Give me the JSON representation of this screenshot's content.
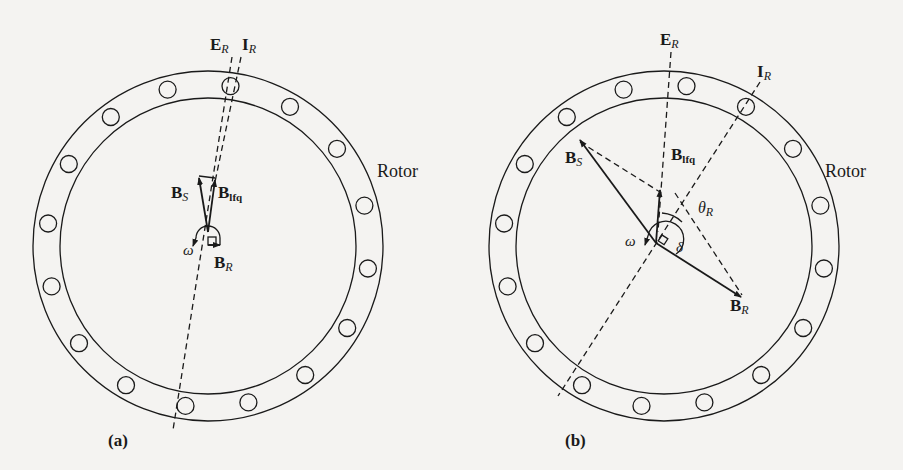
{
  "figure_a": {
    "caption": "(a)",
    "rotor_label": "Rotor",
    "labels": {
      "E": "E",
      "E_sub": "R",
      "I": "I",
      "I_sub": "R",
      "BS": "B",
      "BS_sub": "S",
      "Blfq": "B",
      "Blfq_sub": "lfq",
      "BR": "B",
      "BR_sub": "R",
      "omega": "ω"
    }
  },
  "figure_b": {
    "caption": "(b)",
    "rotor_label": "Rotor",
    "labels": {
      "E": "E",
      "E_sub": "R",
      "I": "I",
      "I_sub": "R",
      "BS": "B",
      "BS_sub": "S",
      "Blfq": "B",
      "Blfq_sub": "lfq",
      "BR": "B",
      "BR_sub": "R",
      "omega": "ω",
      "theta": "θ",
      "theta_sub": "R",
      "delta": "δ"
    }
  }
}
